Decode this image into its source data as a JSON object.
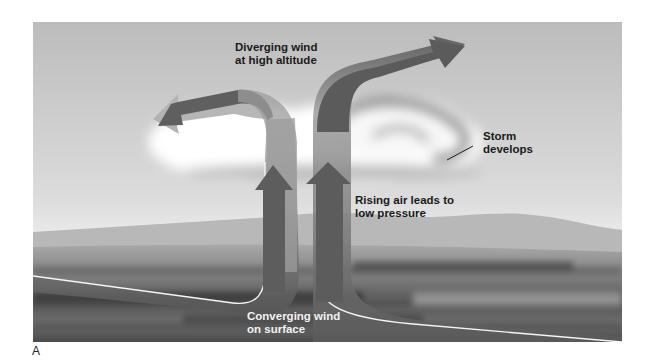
{
  "figure": {
    "panel_letter": "A",
    "labels": {
      "diverging": "Diverging wind\nat high altitude",
      "storm": "Storm\ndevelops",
      "rising": "Rising air leads to\nlow pressure",
      "converging": "Converging wind\non surface"
    },
    "colors": {
      "sky_top": "#bdbdbd",
      "sky_bottom": "#e6e6e6",
      "cloud": "#ffffff",
      "arrow_dark": "#5a5a5a",
      "arrow_light": "#a8a8a8",
      "ground_dark": "#4a4a4a",
      "ground_mid": "#8a8a8a",
      "hills": "#b5b5b5",
      "outline": "#f5f5f5"
    }
  }
}
